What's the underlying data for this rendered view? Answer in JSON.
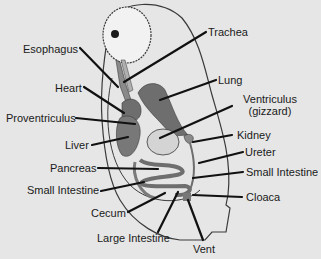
{
  "colors": {
    "background": "#e6e6e6",
    "outline": "#3a3a3a",
    "organ_dark": "#6e6e6e",
    "organ_mid": "#8a8a8a",
    "organ_light": "#cfcfcf",
    "leader": "#111111"
  },
  "labels": {
    "trachea": "Trachea",
    "esophagus": "Esophagus",
    "lung": "Lung",
    "heart": "Heart",
    "ventriculus": "Ventriculus",
    "gizzard": "(gizzard)",
    "proventriculus": "Proventriculus",
    "kidney": "Kidney",
    "liver": "Liver",
    "ureter": "Ureter",
    "pancreas": "Pancreas",
    "small_intestine_left": "Small Intestine",
    "small_intestine_right": "Small Intestine",
    "cloaca": "Cloaca",
    "cecum": "Cecum",
    "large_intestine": "Large Intestine",
    "vent": "Vent"
  }
}
